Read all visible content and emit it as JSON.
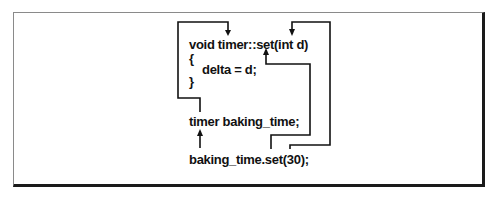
{
  "diagram": {
    "lines": {
      "signature": "void timer::set(int d)",
      "open_brace": "{",
      "body": "delta = d;",
      "close_brace": "}",
      "declaration": "timer baking_time;",
      "call": "baking_time.set(30);"
    },
    "arrows": [
      {
        "from": "declaration",
        "to": "signature.class_name",
        "meaning": "object type refers to class timer"
      },
      {
        "from": "call.object",
        "to": "declaration",
        "meaning": "baking_time object"
      },
      {
        "from": "call.method",
        "to": "signature.method_name",
        "meaning": "set method"
      },
      {
        "from": "call.argument",
        "to": "signature.parameter",
        "meaning": "30 passed to d"
      }
    ],
    "colors": {
      "ink": "#111111",
      "frame_light": "#8a8a8a",
      "frame_shadow": "#1a1a1a",
      "background": "#ffffff"
    }
  }
}
